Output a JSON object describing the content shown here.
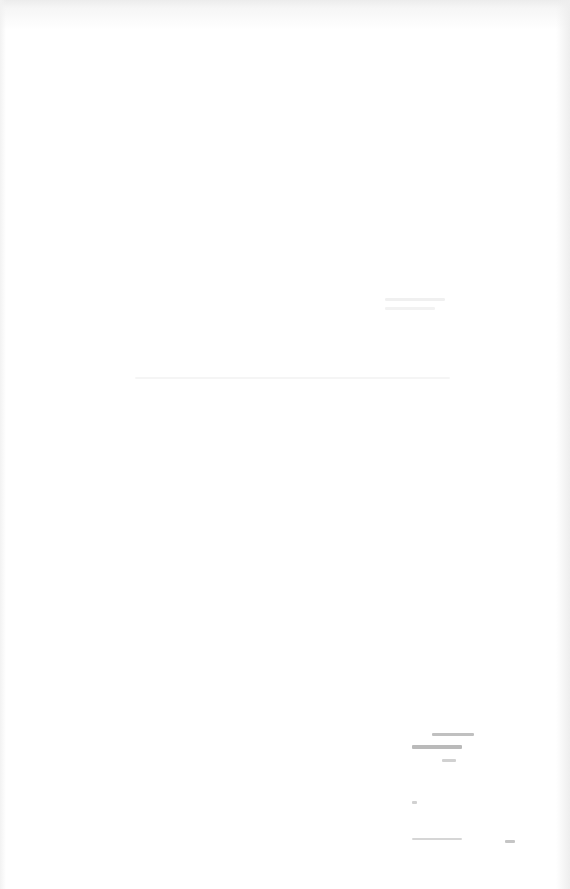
{
  "document": {
    "type": "scanned page (faded, largely illegible)",
    "lines": [
      {
        "text": "",
        "note": "illegible faded text"
      },
      {
        "text": "",
        "note": "illegible faded text"
      },
      {
        "text": "",
        "note": "illegible faded text"
      }
    ],
    "marginalia": {
      "text": "",
      "note": "illegible handwritten/stamped marks, lower right"
    }
  }
}
